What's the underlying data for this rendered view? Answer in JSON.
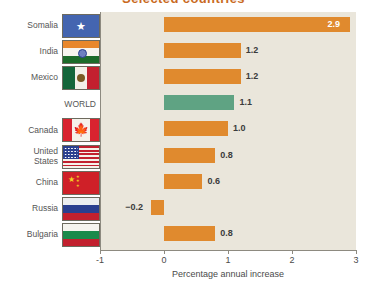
{
  "chart_data": {
    "type": "bar",
    "orientation": "horizontal",
    "title": "Selected countries",
    "xlabel": "Percentage annual increase",
    "ylabel": "",
    "xlim": [
      -1,
      3
    ],
    "xticks": [
      "-1",
      "0",
      "1",
      "2",
      "3"
    ],
    "grid": false,
    "legend": "none",
    "categories": [
      "Somalia",
      "India",
      "Mexico",
      "WORLD",
      "Canada",
      "United\nStates",
      "China",
      "Russia",
      "Bulgaria"
    ],
    "values": [
      2.9,
      1.2,
      1.2,
      1.1,
      1.0,
      0.8,
      0.6,
      -0.2,
      0.8
    ],
    "value_labels": [
      "2.9",
      "1.2",
      "1.2",
      "1.1",
      "1.0",
      "0.8",
      "0.6",
      "−0.2",
      "0.8"
    ],
    "bar_colors": [
      "#e08a2e",
      "#e08a2e",
      "#e08a2e",
      "#5fa383",
      "#e08a2e",
      "#e08a2e",
      "#e08a2e",
      "#e08a2e",
      "#e08a2e"
    ],
    "highlight_series": "WORLD",
    "highlight_color": "#5fa383",
    "series_color": "#e08a2e",
    "plot_background": "#eae6db",
    "axis_color": "#8d8a80"
  },
  "rows": [
    {
      "label": "Somalia",
      "flag": "somalia-flag",
      "value_label": "2.9"
    },
    {
      "label": "India",
      "flag": "india-flag",
      "value_label": "1.2"
    },
    {
      "label": "Mexico",
      "flag": "mexico-flag",
      "value_label": "1.2"
    },
    {
      "label": "WORLD",
      "flag": "no-flag",
      "value_label": "1.1"
    },
    {
      "label": "Canada",
      "flag": "canada-flag",
      "value_label": "1.0"
    },
    {
      "label": "United\nStates",
      "flag": "usa-flag",
      "value_label": "0.8"
    },
    {
      "label": "China",
      "flag": "china-flag",
      "value_label": "0.6"
    },
    {
      "label": "Russia",
      "flag": "russia-flag",
      "value_label": "−0.2"
    },
    {
      "label": "Bulgaria",
      "flag": "bulgaria-flag",
      "value_label": "0.8"
    }
  ],
  "axis": {
    "title": "Percentage annual increase",
    "ticks": [
      "-1",
      "0",
      "1",
      "2",
      "3"
    ]
  },
  "title": {
    "text": "Selected countries"
  }
}
